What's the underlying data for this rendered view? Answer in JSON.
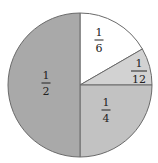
{
  "chart_data": {
    "type": "pie",
    "title": "",
    "center": [
      80,
      85
    ],
    "radius": 72,
    "start_angle_deg": 0,
    "direction": "clockwise",
    "slices": [
      {
        "label": "1/6",
        "numerator": "1",
        "denominator": "6",
        "value": 0.1667,
        "color": "#ffffff",
        "label_pos": [
          99,
          40
        ]
      },
      {
        "label": "1/12",
        "numerator": "1",
        "denominator": "12",
        "value": 0.0833,
        "color": "#d2d2d2",
        "label_pos": [
          139,
          71
        ]
      },
      {
        "label": "1/4",
        "numerator": "1",
        "denominator": "4",
        "value": 0.25,
        "color": "#c2c2c2",
        "label_pos": [
          106,
          110
        ]
      },
      {
        "label": "1/2",
        "numerator": "1",
        "denominator": "2",
        "value": 0.5,
        "color": "#a9a9a9",
        "label_pos": [
          46,
          83
        ]
      }
    ],
    "stroke_color": "#6a6a6a",
    "legend": "none"
  }
}
